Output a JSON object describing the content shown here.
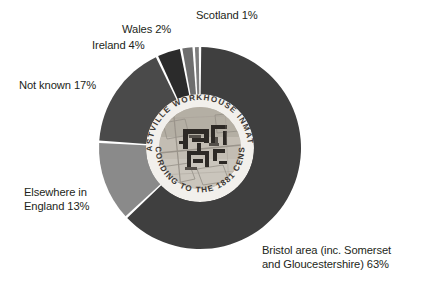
{
  "chart_data": {
    "type": "pie",
    "xlabel": "",
    "ylabel": "",
    "unit": "%",
    "legend_position": "outside-labels",
    "grid": false,
    "categories": [
      "Bristol area (inc. Somerset and Gloucestershire)",
      "Elsewhere in England",
      "Not known",
      "Ireland",
      "Wales",
      "Scotland"
    ],
    "values": [
      63,
      13,
      17,
      4,
      2,
      1
    ],
    "colors": [
      "#3f3f3f",
      "#8a8a8a",
      "#4a4a4a",
      "#2b2b2b",
      "#6e6e6e",
      "#7d7d7d"
    ],
    "slices": [
      {
        "label": "Bristol area (inc. Somerset and Gloucestershire)",
        "value": 63,
        "label_text": "Bristol area (inc. Somerset and Gloucestershire) 63%",
        "color": "#3f3f3f"
      },
      {
        "label": "Elsewhere in England",
        "value": 13,
        "label_text": "Elsewhere in England 13%",
        "color": "#8a8a8a"
      },
      {
        "label": "Not known",
        "value": 17,
        "label_text": "Not known 17%",
        "color": "#4a4a4a"
      },
      {
        "label": "Ireland",
        "value": 4,
        "label_text": "Ireland 4%",
        "color": "#2b2b2b"
      },
      {
        "label": "Wales",
        "value": 2,
        "label_text": "Wales 2%",
        "color": "#6e6e6e"
      },
      {
        "label": "Scotland",
        "value": 1,
        "label_text": "Scotland 1%",
        "color": "#7d7d7d"
      }
    ]
  },
  "labels": {
    "scotland": "Scotland 1%",
    "wales": "Wales 2%",
    "ireland": "Ireland 4%",
    "not_known": "Not known 17%",
    "elsewhere_line1": "Elsewhere in",
    "elsewhere_line2": "England 13%",
    "bristol_line1": "Bristol area (inc. Somerset",
    "bristol_line2": "and Gloucestershire) 63%"
  },
  "center_badge": {
    "top_arc_text": "· EASTVILLE WORKHOUSE INMATES ·",
    "bottom_arc_text": "ACCORDING TO THE 1881 CENSUS",
    "image_caption": "historic map of Eastville Workhouse site"
  },
  "colors": {
    "background": "#ffffff",
    "text": "#231f20",
    "slice_gap": "#ffffff",
    "badge_ring": "#f2f0ec"
  }
}
